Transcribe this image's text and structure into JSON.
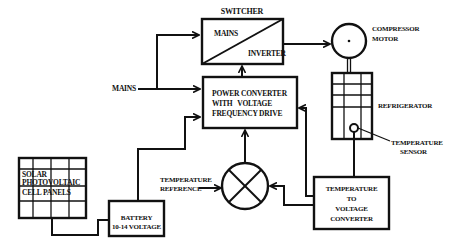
{
  "diagram": {
    "type": "block-diagram",
    "colors": {
      "line": "#111111",
      "background": "#ffffff"
    },
    "blocks": {
      "switcher": {
        "title": "SWITCHER",
        "top_left": "MAINS",
        "bottom_right": "INVERTER"
      },
      "power_converter": {
        "line1": "POWER CONVERTER",
        "line2": "WITH   VOLTAGE",
        "line3": "FREQUENCY DRIVE"
      },
      "compressor_motor": {
        "line1": "COMPRESSOR",
        "line2": "MOTOR"
      },
      "refrigerator": {
        "label": "REFRIGERATOR"
      },
      "temperature_sensor": {
        "line1": "TEMPERATURE",
        "line2": "SENSOR"
      },
      "solar_panels": {
        "line1": "SOLAR",
        "line2": "PHOTOVOLTAIC",
        "line3": "CELL PANELS"
      },
      "battery": {
        "line1": "BATTERY",
        "line2": "10-14 VOLTAGE"
      },
      "temperature_reference": {
        "line1": "TEMPERATURE",
        "line2": "REFERENCE"
      },
      "temp_to_voltage": {
        "line1": "TEMPERATURE",
        "line2": "TO",
        "line3": "VOLTAGE",
        "line4": "CONVERTER"
      },
      "mains_input": {
        "label": "MAINS"
      },
      "comparator": {
        "symbol": "summing-junction-x"
      }
    },
    "connections": [
      {
        "from": "MAINS",
        "to": "SWITCHER"
      },
      {
        "from": "MAINS",
        "to": "POWER CONVERTER WITH VOLTAGE FREQUENCY DRIVE"
      },
      {
        "from": "POWER CONVERTER WITH VOLTAGE FREQUENCY DRIVE",
        "to": "SWITCHER"
      },
      {
        "from": "SWITCHER",
        "to": "COMPRESSOR MOTOR"
      },
      {
        "from": "COMPRESSOR MOTOR",
        "to": "REFRIGERATOR"
      },
      {
        "from": "TEMPERATURE SENSOR",
        "to": "TEMPERATURE TO VOLTAGE CONVERTER"
      },
      {
        "from": "TEMPERATURE TO VOLTAGE CONVERTER",
        "to": "POWER CONVERTER WITH VOLTAGE FREQUENCY DRIVE"
      },
      {
        "from": "TEMPERATURE TO VOLTAGE CONVERTER",
        "to": "comparator"
      },
      {
        "from": "TEMPERATURE REFERENCE",
        "to": "comparator"
      },
      {
        "from": "comparator",
        "to": "POWER CONVERTER WITH VOLTAGE FREQUENCY DRIVE"
      },
      {
        "from": "SOLAR PHOTOVOLTAIC CELL PANELS",
        "to": "BATTERY 10-14 VOLTAGE"
      },
      {
        "from": "BATTERY 10-14 VOLTAGE",
        "to": "POWER CONVERTER WITH VOLTAGE FREQUENCY DRIVE"
      }
    ]
  }
}
